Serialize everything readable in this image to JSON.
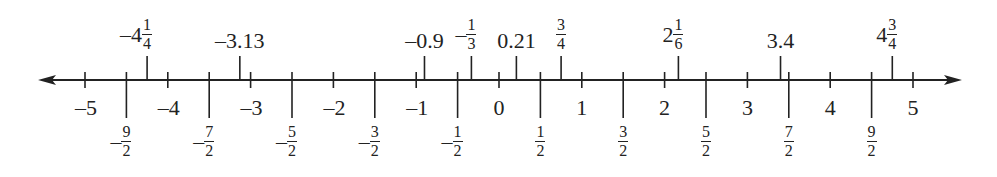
{
  "chart_data": {
    "type": "number_line",
    "title": "",
    "range": [
      -5,
      5
    ],
    "arrows": "both",
    "integer_ticks": [
      -5,
      -4,
      -3,
      -2,
      -1,
      0,
      1,
      2,
      3,
      4,
      5
    ],
    "integer_labels": [
      "–5",
      "–4",
      "–3",
      "–2",
      "–1",
      "0",
      "1",
      "2",
      "3",
      "4",
      "5"
    ],
    "half_ticks": [
      {
        "value": -4.5,
        "sign": "–",
        "num": "9",
        "den": "2"
      },
      {
        "value": -3.5,
        "sign": "–",
        "num": "7",
        "den": "2"
      },
      {
        "value": -2.5,
        "sign": "–",
        "num": "5",
        "den": "2"
      },
      {
        "value": -1.5,
        "sign": "–",
        "num": "3",
        "den": "2"
      },
      {
        "value": -0.5,
        "sign": "–",
        "num": "1",
        "den": "2"
      },
      {
        "value": 0.5,
        "sign": "",
        "num": "1",
        "den": "2"
      },
      {
        "value": 1.5,
        "sign": "",
        "num": "3",
        "den": "2"
      },
      {
        "value": 2.5,
        "sign": "",
        "num": "5",
        "den": "2"
      },
      {
        "value": 3.5,
        "sign": "",
        "num": "7",
        "den": "2"
      },
      {
        "value": 4.5,
        "sign": "",
        "num": "9",
        "den": "2"
      }
    ],
    "plotted_points": [
      {
        "value": -4.25,
        "label": {
          "whole": "–4",
          "num": "1",
          "den": "4"
        }
      },
      {
        "value": -3.13,
        "label": {
          "text": "–3.13"
        }
      },
      {
        "value": -0.9,
        "label": {
          "text": "–0.9"
        }
      },
      {
        "value": -0.3333,
        "label": {
          "whole": "–",
          "num": "1",
          "den": "3"
        }
      },
      {
        "value": 0.21,
        "label": {
          "text": "0.21"
        }
      },
      {
        "value": 0.75,
        "label": {
          "whole": "",
          "num": "3",
          "den": "4"
        }
      },
      {
        "value": 2.1667,
        "label": {
          "whole": "2",
          "num": "1",
          "den": "6"
        }
      },
      {
        "value": 3.4,
        "label": {
          "text": "3.4"
        }
      },
      {
        "value": 4.75,
        "label": {
          "whole": "4",
          "num": "3",
          "den": "4"
        }
      }
    ]
  },
  "layout": {
    "axis_y": 80,
    "x_zero": 499,
    "unit_px": 82.8,
    "line_left": 38,
    "line_right": 962,
    "color": "#222222"
  }
}
